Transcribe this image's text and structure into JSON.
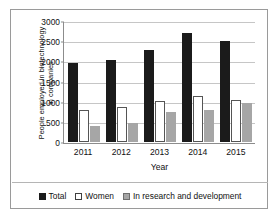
{
  "chart_data": {
    "type": "bar",
    "title": "",
    "xlabel": "Year",
    "ylabel": "People employed in biotechnology in companies",
    "ylabel_line1": "People employed in biotechnology",
    "ylabel_line2": "in companies",
    "categories": [
      "2011",
      "2012",
      "2013",
      "2014",
      "2015"
    ],
    "yticks": [
      0,
      500,
      1000,
      1500,
      2000,
      2500,
      3000
    ],
    "ytick_labels": [
      "0",
      "500",
      "1000",
      "1500",
      "2000",
      "2500",
      "3000"
    ],
    "ylim": [
      0,
      3000
    ],
    "grid": true,
    "legend_position": "bottom",
    "series": [
      {
        "name": "Total",
        "color": "#1b1b1b",
        "values": [
          1980,
          2040,
          2300,
          2730,
          2520
        ]
      },
      {
        "name": "Women",
        "color": "#ffffff",
        "values": [
          810,
          880,
          1020,
          1150,
          1040
        ]
      },
      {
        "name": "In research and development",
        "color": "#a6a6a6",
        "values": [
          390,
          470,
          760,
          800,
          985
        ]
      }
    ]
  },
  "legend": {
    "items": [
      {
        "label": "Total"
      },
      {
        "label": "Women"
      },
      {
        "label": "In research and development"
      }
    ]
  }
}
